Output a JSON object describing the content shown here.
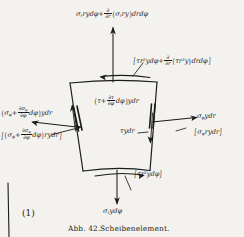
{
  "figure": {
    "caption_number": "Abb. 42.",
    "caption_text": "Scheibenelement.",
    "equation_number": "(1)",
    "ink_color": "#1b1b1b",
    "background_color": "#f4f2ee"
  },
  "labels": {
    "top_radial": {
      "name": "top-radial-stress-label",
      "symbol": "σ",
      "sub": "r",
      "text": "σ_r ry dφ + ∂/∂r(σ_r ry) dr dφ",
      "parts": {
        "lead": "ry dφ+",
        "frac_num": "∂",
        "frac_den": "∂r",
        "inner": "ry) dr dφ"
      }
    },
    "top_shear": {
      "name": "top-shear-stress-label",
      "text": "[τr²y dφ + ∂/∂r(τr²y) dr dφ]",
      "parts": {
        "lead": "τr",
        "lead_sup": "2",
        "lead_tail": "y dφ+",
        "frac_num": "∂",
        "frac_den": "∂r",
        "inner": "τr",
        "inner_sup": "2",
        "inner_tail": "y) dr dφ"
      }
    },
    "inner_shear": {
      "name": "inner-shear-stress-label",
      "text": "(τ + ∂τ/∂φ dφ) y dr",
      "parts": {
        "lead": "τ+",
        "frac_num": "∂τ",
        "frac_den": "∂φ",
        "tail": "dφ) y dr"
      }
    },
    "left_hoop": {
      "name": "left-hoop-stress-label",
      "text": "(σ_φ + ∂σ_φ/∂φ dφ) y dr",
      "parts": {
        "lead": "σ",
        "lead_sub": "φ",
        "plus": "+",
        "frac_num": "∂σ",
        "frac_num_sub": "φ",
        "frac_den": "∂φ",
        "tail": "dφ) y dr"
      }
    },
    "left_hoop_bracket": {
      "name": "left-hoop-moment-label",
      "text": "[(σ_φ + ∂σ_φ/∂φ dφ) ry dr]",
      "parts": {
        "lead": "σ",
        "lead_sub": "φ",
        "plus": "+",
        "frac_num": "∂σ",
        "frac_num_sub": "φ",
        "frac_den": "∂φ",
        "tail": "dφ) ry dr"
      }
    },
    "right_hoop": {
      "name": "right-hoop-stress-label",
      "text": "σ_φ y dr",
      "parts": {
        "sym": "σ",
        "sub": "φ",
        "tail": "y dr"
      }
    },
    "right_hoop_bracket": {
      "name": "right-hoop-moment-label",
      "text": "[σ_φ ry dr]",
      "parts": {
        "sym": "σ",
        "sub": "φ",
        "tail": "ry dr"
      }
    },
    "center_shear": {
      "name": "center-shear-stress-label",
      "text": "τ y dr"
    },
    "bottom_shear_bracket": {
      "name": "bottom-shear-moment-label",
      "text": "[τr²y dφ]",
      "parts": {
        "sym": "τr",
        "sup": "2",
        "tail": "y dφ"
      }
    },
    "bottom_radial": {
      "name": "bottom-radial-stress-label",
      "text": "σ_r y dφ",
      "parts": {
        "sym": "σ",
        "sub": "r",
        "tail": "y dφ"
      }
    }
  }
}
